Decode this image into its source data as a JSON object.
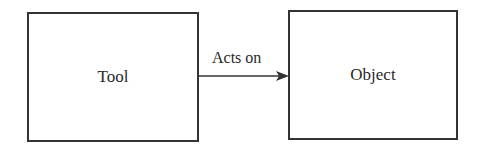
{
  "diagram": {
    "nodes": [
      {
        "id": "tool",
        "label": "Tool"
      },
      {
        "id": "object",
        "label": "Object"
      }
    ],
    "edges": [
      {
        "from": "tool",
        "to": "object",
        "label": "Acts on"
      }
    ]
  }
}
